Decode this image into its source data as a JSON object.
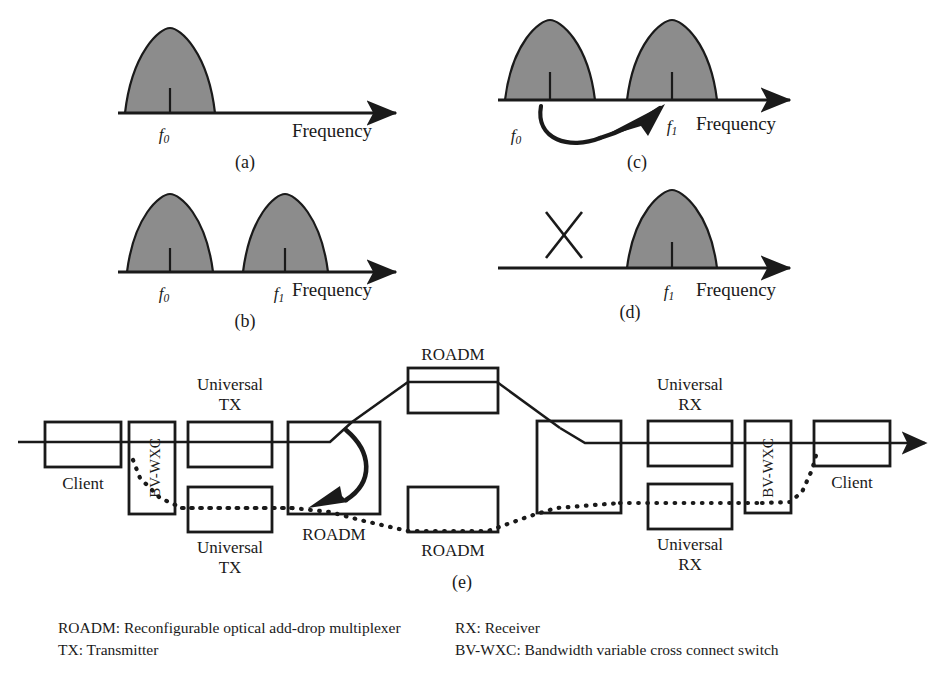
{
  "figure": {
    "caption_labels": {
      "a": "(a)",
      "b": "(b)",
      "c": "(c)",
      "d": "(d)",
      "e": "(e)"
    },
    "axis_label": "Frequency",
    "freq_f0": "f",
    "freq_f0_sub": "0",
    "freq_f1": "f",
    "freq_f1_sub": "1",
    "fill_color": "#8c8c8c",
    "line_color": "#1a1a1a"
  },
  "spectra": {
    "panel_a": {
      "id": "(a)",
      "peaks": [
        {
          "label": "f0",
          "center": 170
        }
      ],
      "axis_label": "Frequency",
      "description": "single spectral peak at f0"
    },
    "panel_b": {
      "id": "(b)",
      "peaks": [
        {
          "label": "f0",
          "center": 170
        },
        {
          "label": "f1",
          "center": 285
        }
      ],
      "axis_label": "Frequency",
      "description": "two spectral peaks at f0 and f1"
    },
    "panel_c": {
      "id": "(c)",
      "peaks": [
        {
          "label": "f0",
          "center": 550
        },
        {
          "label": "f1",
          "center": 672
        }
      ],
      "axis_label": "Frequency",
      "arrow": "curved arrow from f0 to f1",
      "description": "two peaks with curved transition arrow f0 to f1"
    },
    "panel_d": {
      "id": "(d)",
      "peaks": [
        {
          "label": "f1",
          "center": 672
        }
      ],
      "axis_label": "Frequency",
      "cross_mark": "X",
      "description": "f0 removed (X) leaving only f1"
    }
  },
  "network": {
    "id": "(e)",
    "nodes": [
      {
        "name": "client-left",
        "label": "Client",
        "label_pos": "below"
      },
      {
        "name": "bvwxc-left",
        "label": "BV-WXC",
        "label_pos": "inside-vertical"
      },
      {
        "name": "universal-tx-top",
        "label": "Universal\nTX",
        "label_pos": "above"
      },
      {
        "name": "universal-tx-bottom",
        "label": "Universal\nTX",
        "label_pos": "below"
      },
      {
        "name": "roadm-left",
        "label": "ROADM",
        "label_pos": "below"
      },
      {
        "name": "roadm-top",
        "label": "ROADM",
        "label_pos": "above"
      },
      {
        "name": "roadm-bottom",
        "label": "ROADM",
        "label_pos": "below"
      },
      {
        "name": "roadm-right",
        "label": "ROADM",
        "label_pos": "none"
      },
      {
        "name": "universal-rx-top",
        "label": "Universal\nRX",
        "label_pos": "above"
      },
      {
        "name": "universal-rx-bottom",
        "label": "Universal\nRX",
        "label_pos": "below"
      },
      {
        "name": "bvwxc-right",
        "label": "BV-WXC",
        "label_pos": "inside-vertical"
      },
      {
        "name": "client-right",
        "label": "Client",
        "label_pos": "below"
      }
    ],
    "labels": {
      "universal_tx": "Universal",
      "tx": "TX",
      "universal_rx": "Universal",
      "rx": "RX",
      "client": "Client",
      "roadm": "ROADM",
      "bvwxc": "BV-WXC"
    }
  },
  "legend": {
    "left": [
      "ROADM: Reconfigurable optical add-drop multiplexer",
      "TX: Transmitter"
    ],
    "right": [
      "RX: Receiver",
      "BV-WXC: Bandwidth variable cross connect switch"
    ]
  }
}
